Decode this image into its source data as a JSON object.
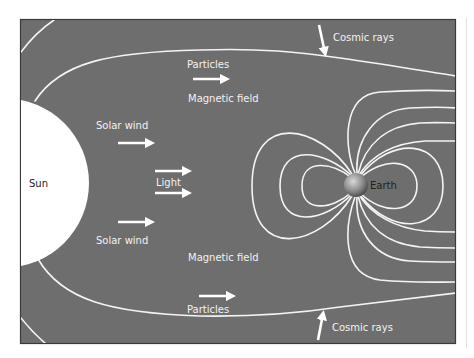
{
  "diagram": {
    "colors": {
      "background": "#6e6e6e",
      "lines": "#f4f4f4",
      "sun": "#ffffff",
      "page": "#ffffff"
    },
    "labels": {
      "sun": "Sun",
      "earth": "Earth",
      "light": "Light",
      "solar_wind_top": "Solar wind",
      "solar_wind_bottom": "Solar wind",
      "particles_top": "Particles",
      "particles_bottom": "Particles",
      "magnetic_field_top": "Magnetic field",
      "magnetic_field_bottom": "Magnetic field",
      "cosmic_rays_top": "Cosmic rays",
      "cosmic_rays_bottom": "Cosmic rays"
    },
    "arrows": [
      {
        "name": "particles-top-arrow",
        "direction": "right"
      },
      {
        "name": "solar-wind-top-arrow",
        "direction": "right"
      },
      {
        "name": "light-top-arrow",
        "direction": "right"
      },
      {
        "name": "light-bottom-arrow",
        "direction": "right"
      },
      {
        "name": "solar-wind-bottom-arrow",
        "direction": "right"
      },
      {
        "name": "particles-bottom-arrow",
        "direction": "right"
      },
      {
        "name": "cosmic-rays-top-arrow",
        "direction": "down"
      },
      {
        "name": "cosmic-rays-bottom-arrow",
        "direction": "up"
      }
    ],
    "icons": {
      "sun": "sun-disc-icon",
      "earth": "earth-sphere-icon"
    }
  }
}
